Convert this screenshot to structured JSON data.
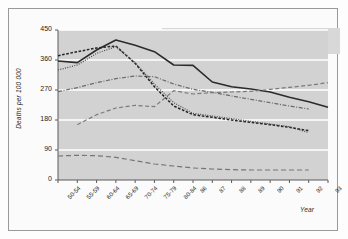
{
  "figure": {
    "frame_color": "#9a9a9a",
    "plot_bg": "#d2d2d2",
    "grid_color": "#ffffff"
  },
  "chart_data": {
    "type": "line",
    "title": "",
    "xlabel": "Year",
    "ylabel": "Deaths per 100 000",
    "xlim_categories": true,
    "ylim": [
      0,
      450
    ],
    "yticks": [
      0,
      90,
      180,
      270,
      360,
      450
    ],
    "grid": "horizontal",
    "legend_position": "top-right-inside",
    "categories": [
      "50-54",
      "55-59",
      "60-64",
      "65-69",
      "70-74",
      "75-79",
      "80-84",
      "86",
      "87",
      "88",
      "89",
      "90",
      "91",
      "92",
      "93"
    ],
    "series": [
      {
        "name": "Finland",
        "style": "solid",
        "color": "#2b2b2b",
        "values": [
          357,
          352,
          390,
          420,
          404,
          385,
          345,
          344,
          294,
          280,
          273,
          264,
          248,
          235,
          218
        ]
      },
      {
        "name": "USA",
        "style": "dashed-thick",
        "color": "#232323",
        "values": [
          373,
          385,
          396,
          402,
          350,
          280,
          222,
          196,
          188,
          180,
          173,
          166,
          158,
          148,
          null
        ]
      },
      {
        "name": "Australia",
        "style": "dotted",
        "color": "#4a4a4a",
        "values": [
          330,
          345,
          380,
          400,
          352,
          288,
          232,
          200,
          192,
          184,
          176,
          168,
          160,
          142,
          null
        ]
      },
      {
        "name": "UK",
        "style": "dash-dot",
        "color": "#6a6a6a",
        "values": [
          265,
          277,
          292,
          304,
          312,
          310,
          288,
          272,
          263,
          252,
          242,
          232,
          222,
          213,
          null
        ]
      },
      {
        "name": "Hungary",
        "style": "dashed",
        "color": "#7a7a7a",
        "values": [
          null,
          166,
          196,
          216,
          224,
          220,
          268,
          258,
          262,
          264,
          266,
          272,
          278,
          284,
          292
        ]
      },
      {
        "name": "Japan",
        "style": "long-dash",
        "color": "#757575",
        "values": [
          72,
          74,
          73,
          68,
          58,
          48,
          42,
          36,
          33,
          31,
          30,
          30,
          30,
          30,
          null
        ]
      }
    ],
    "legend": [
      {
        "label": "Finland",
        "style": "solid",
        "color": "#2b2b2b"
      },
      {
        "label": "Australia",
        "style": "dotted",
        "color": "#4a4a4a"
      },
      {
        "label": "Hungary",
        "style": "dashed",
        "color": "#7a7a7a"
      },
      {
        "label": "USA",
        "style": "dashed-thick",
        "color": "#232323"
      },
      {
        "label": "UK",
        "style": "dash-dot",
        "color": "#6a6a6a"
      },
      {
        "label": "Japan",
        "style": "long-dash",
        "color": "#757575"
      }
    ]
  }
}
